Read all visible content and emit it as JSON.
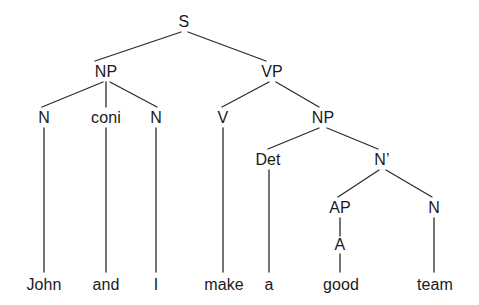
{
  "diagram": {
    "type": "constituency-syntax-tree",
    "sentence": "John and I make a good team",
    "line_color": "#2b2b2b",
    "text_color": "#1a1a1a",
    "background_color": "#ffffff",
    "nodes": [
      {
        "id": "S",
        "label": "S",
        "x": 184,
        "y": 22,
        "kind": "phrase"
      },
      {
        "id": "NP1",
        "label": "NP",
        "x": 106,
        "y": 72,
        "kind": "phrase"
      },
      {
        "id": "VP",
        "label": "VP",
        "x": 272,
        "y": 72,
        "kind": "phrase"
      },
      {
        "id": "N1",
        "label": "N",
        "x": 44,
        "y": 118,
        "kind": "lexical"
      },
      {
        "id": "CONJ",
        "label": "coni",
        "x": 106,
        "y": 118,
        "kind": "lexical"
      },
      {
        "id": "N2",
        "label": "N",
        "x": 156,
        "y": 118,
        "kind": "lexical"
      },
      {
        "id": "V",
        "label": "V",
        "x": 223,
        "y": 118,
        "kind": "lexical"
      },
      {
        "id": "NP2",
        "label": "NP",
        "x": 323,
        "y": 118,
        "kind": "phrase"
      },
      {
        "id": "DET",
        "label": "Det",
        "x": 268,
        "y": 160,
        "kind": "lexical"
      },
      {
        "id": "NBAR",
        "label": "N’",
        "x": 382,
        "y": 160,
        "kind": "phrase"
      },
      {
        "id": "AP",
        "label": "AP",
        "x": 340,
        "y": 208,
        "kind": "phrase"
      },
      {
        "id": "N3",
        "label": "N",
        "x": 434,
        "y": 208,
        "kind": "lexical"
      },
      {
        "id": "A",
        "label": "A",
        "x": 340,
        "y": 245,
        "kind": "lexical"
      }
    ],
    "leaves": [
      {
        "id": "w-john",
        "label": "John",
        "x": 44,
        "y": 285,
        "parent": "N1"
      },
      {
        "id": "w-and",
        "label": "and",
        "x": 106,
        "y": 285,
        "parent": "CONJ"
      },
      {
        "id": "w-i",
        "label": "I",
        "x": 156,
        "y": 285,
        "parent": "N2"
      },
      {
        "id": "w-make",
        "label": "make",
        "x": 224,
        "y": 285,
        "parent": "V"
      },
      {
        "id": "w-a",
        "label": "a",
        "x": 269,
        "y": 285,
        "parent": "DET"
      },
      {
        "id": "w-good",
        "label": "good",
        "x": 341,
        "y": 285,
        "parent": "A"
      },
      {
        "id": "w-team",
        "label": "team",
        "x": 435,
        "y": 285,
        "parent": "N3"
      }
    ],
    "edges": [
      {
        "from": "S",
        "to": "NP1",
        "x1": 181,
        "y1": 32,
        "x2": 95,
        "y2": 61
      },
      {
        "from": "S",
        "to": "VP",
        "x1": 188,
        "y1": 32,
        "x2": 266,
        "y2": 61
      },
      {
        "from": "NP1",
        "to": "N1",
        "x1": 103,
        "y1": 82,
        "x2": 42,
        "y2": 107
      },
      {
        "from": "NP1",
        "to": "CONJ",
        "x1": 106,
        "y1": 82,
        "x2": 106,
        "y2": 107
      },
      {
        "from": "NP1",
        "to": "N2",
        "x1": 110,
        "y1": 82,
        "x2": 157,
        "y2": 107
      },
      {
        "from": "VP",
        "to": "V",
        "x1": 269,
        "y1": 82,
        "x2": 222,
        "y2": 107
      },
      {
        "from": "VP",
        "to": "NP2",
        "x1": 276,
        "y1": 82,
        "x2": 319,
        "y2": 107
      },
      {
        "from": "NP2",
        "to": "DET",
        "x1": 319,
        "y1": 128,
        "x2": 268,
        "y2": 149
      },
      {
        "from": "NP2",
        "to": "NBAR",
        "x1": 327,
        "y1": 128,
        "x2": 378,
        "y2": 149
      },
      {
        "from": "NBAR",
        "to": "AP",
        "x1": 379,
        "y1": 170,
        "x2": 338,
        "y2": 197
      },
      {
        "from": "NBAR",
        "to": "N3",
        "x1": 386,
        "y1": 170,
        "x2": 432,
        "y2": 197
      },
      {
        "from": "AP",
        "to": "A",
        "x1": 340,
        "y1": 218,
        "x2": 340,
        "y2": 236
      },
      {
        "from": "A",
        "to": "w-good",
        "x1": 340,
        "y1": 254,
        "x2": 340,
        "y2": 272
      },
      {
        "from": "N1",
        "to": "w-john",
        "x1": 44,
        "y1": 128,
        "x2": 44,
        "y2": 272
      },
      {
        "from": "CONJ",
        "to": "w-and",
        "x1": 106,
        "y1": 128,
        "x2": 106,
        "y2": 272
      },
      {
        "from": "N2",
        "to": "w-i",
        "x1": 156,
        "y1": 128,
        "x2": 156,
        "y2": 272
      },
      {
        "from": "V",
        "to": "w-make",
        "x1": 223,
        "y1": 128,
        "x2": 223,
        "y2": 272
      },
      {
        "from": "DET",
        "to": "w-a",
        "x1": 269,
        "y1": 170,
        "x2": 269,
        "y2": 272
      },
      {
        "from": "N3",
        "to": "w-team",
        "x1": 434,
        "y1": 218,
        "x2": 434,
        "y2": 272
      }
    ]
  }
}
